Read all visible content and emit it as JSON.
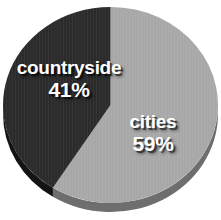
{
  "chart_data": {
    "type": "pie",
    "title": "",
    "subtitle": "",
    "xlabel": "",
    "ylabel": "",
    "legend_position": "none",
    "grid": false,
    "units": "%",
    "categories": [
      "countryside",
      "cities"
    ],
    "values": [
      41,
      59
    ],
    "slices": [
      {
        "label": "countryside",
        "value": 41,
        "value_text": "41%",
        "color": "#2b2b2b",
        "side_color": "#141414",
        "label_color": "#ffffff"
      },
      {
        "label": "cities",
        "value": 59,
        "value_text": "59%",
        "color": "#a8a8a8",
        "side_color": "#6e6e6e",
        "label_color": "#ffffff"
      }
    ]
  },
  "figure": {
    "background": "#ffffff",
    "style": "3d-pie",
    "depth_px": 9
  }
}
